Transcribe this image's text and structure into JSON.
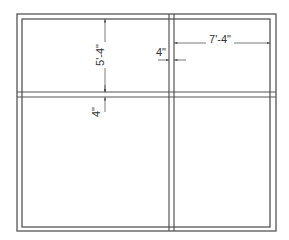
{
  "diagram": {
    "type": "window-elevation",
    "colors": {
      "frame": "#555555",
      "dimension": "#444444",
      "text": "#333333",
      "background": "#ffffff"
    },
    "frame": {
      "outer": {
        "x1": 17,
        "y1": 14,
        "x2": 276,
        "y2": 231
      },
      "inner": {
        "x1": 22,
        "y1": 19,
        "x2": 270,
        "y2": 227
      }
    },
    "mullion_vertical": {
      "x_left": 169,
      "x_right": 174
    },
    "mullion_horizontal": {
      "y_top": 92,
      "y_bottom": 97
    },
    "dimensions": {
      "top_pane_height": {
        "label": "5'-4\""
      },
      "horizontal_mullion": {
        "label": "4\""
      },
      "right_pane_width": {
        "label": "7'-4\""
      },
      "vertical_mullion": {
        "label": "4\""
      }
    }
  }
}
